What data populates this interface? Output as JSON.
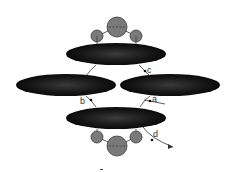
{
  "diagram": {
    "labels": {
      "a": "a",
      "b": "b",
      "c": "c",
      "d": "d"
    },
    "colors": {
      "ellipse_fill": "#111111",
      "ellipse_highlight": "#3a3a3a",
      "circle_fill": "#7a7a7a",
      "circle_stroke": "#3a3a3a",
      "line": "#333333",
      "background": "#ffffff"
    }
  }
}
